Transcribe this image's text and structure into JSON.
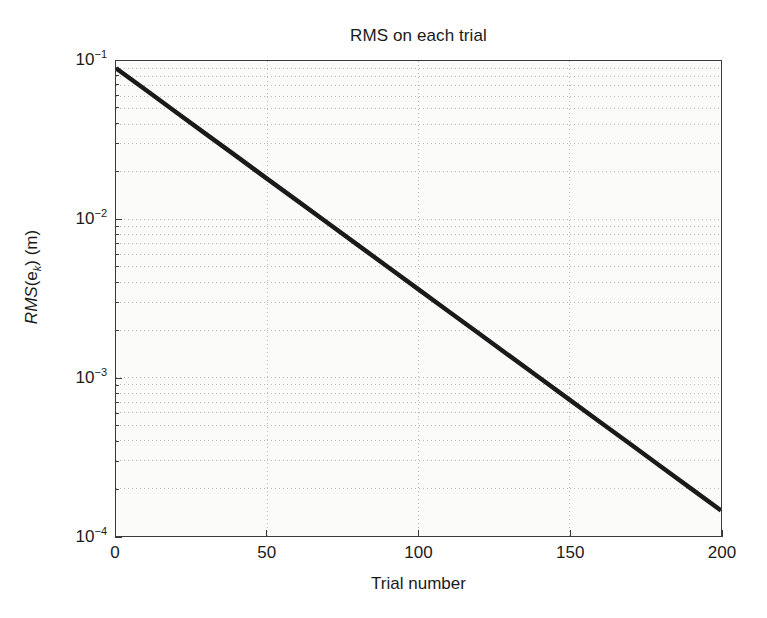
{
  "chart_data": {
    "type": "line",
    "title": "RMS on each trial",
    "xlabel": "Trial number",
    "ylabel_parts": {
      "italic_prefix": "RMS",
      "open_paren": "(e",
      "subscript": "k",
      "suffix": ") (m)"
    },
    "ylabel_plain": "RMS(e_k) (m)",
    "xscale": "linear",
    "yscale": "log",
    "xlim": [
      0,
      200
    ],
    "ylim": [
      0.0001,
      0.1
    ],
    "grid": "major-and-minor-dotted",
    "legend": "none",
    "xticks": [
      0,
      50,
      100,
      150,
      200
    ],
    "xticklabels": [
      "0",
      "50",
      "100",
      "150",
      "200"
    ],
    "yticks": [
      0.1,
      0.01,
      0.001,
      0.0001
    ],
    "yticklabels": [
      {
        "mantissa": "10",
        "exponent": "−1"
      },
      {
        "mantissa": "10",
        "exponent": "−2"
      },
      {
        "mantissa": "10",
        "exponent": "−3"
      },
      {
        "mantissa": "10",
        "exponent": "−4"
      }
    ],
    "series": [
      {
        "name": "RMS(e_k)",
        "color": "#1a1a1a",
        "linewidth": 4.5,
        "x": [
          0,
          10,
          20,
          30,
          40,
          50,
          60,
          70,
          80,
          90,
          100,
          110,
          120,
          130,
          140,
          150,
          160,
          170,
          180,
          190,
          200
        ],
        "y": [
          0.09,
          0.0653,
          0.0473,
          0.0343,
          0.0249,
          0.018,
          0.01307,
          0.00948,
          0.00687,
          0.00498,
          0.00361,
          0.00262,
          0.0019,
          0.001377,
          0.000998,
          0.000724,
          0.000525,
          0.000381,
          0.000276,
          0.0002,
          0.000145
        ]
      }
    ],
    "annotations": []
  },
  "colors": {
    "axis": "#3a3a3a",
    "grid": "#b9b9b9",
    "line": "#1a1a1a",
    "plot_background": "#fbfbf9",
    "page_background": "#ffffff",
    "text": "#1a1a1a"
  }
}
